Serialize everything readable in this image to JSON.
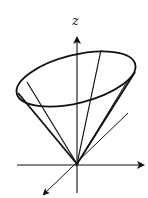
{
  "figure": {
    "stroke_color": "#111111",
    "background": "#ffffff"
  },
  "axes": {
    "z_label": "z",
    "origin": [
      77,
      164
    ],
    "z_axis": {
      "from": [
        77,
        193
      ],
      "to": [
        77,
        36
      ]
    },
    "x_axis": {
      "from": [
        17,
        165
      ],
      "to": [
        145,
        165
      ]
    },
    "y_axis": {
      "from": [
        128,
        113
      ],
      "to": [
        42,
        196
      ]
    }
  },
  "cone": {
    "apex": [
      77,
      164
    ],
    "rim_ellipse": {
      "cx": 76,
      "cy": 79,
      "rx": 61,
      "ry": 24,
      "rotation_deg": -14
    },
    "generators": [
      {
        "from": [
          18,
          92
        ],
        "to": [
          77,
          164
        ]
      },
      {
        "from": [
          27,
          82
        ],
        "to": [
          77,
          164
        ]
      },
      {
        "from": [
          101,
          50
        ],
        "to": [
          77,
          164
        ]
      },
      {
        "from": [
          135,
          71
        ],
        "to": [
          77,
          164
        ]
      },
      {
        "from": [
          129,
          80
        ],
        "to": [
          77,
          164
        ]
      }
    ]
  }
}
